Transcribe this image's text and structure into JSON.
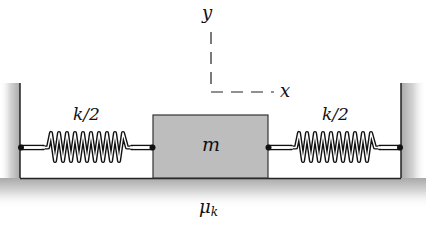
{
  "diagram": {
    "mass": {
      "label": "m",
      "fill": "#bdbdbd"
    },
    "springs": [
      {
        "id": "left",
        "label": "k/2"
      },
      {
        "id": "right",
        "label": "k/2"
      }
    ],
    "axes": {
      "y_label": "y",
      "x_label": "x"
    },
    "friction": {
      "symbol": "μ",
      "subscript": "k"
    },
    "colors": {
      "line": "#222222",
      "wall_shade": "#b0b0b0",
      "block": "#bdbdbd"
    }
  }
}
